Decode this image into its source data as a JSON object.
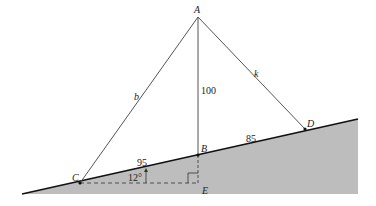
{
  "diagram": {
    "colors": {
      "ground_fill": "#bdbdbd",
      "line": "#555555",
      "slope_line": "#111111"
    },
    "points": {
      "A": {
        "label": "A",
        "x": 198,
        "y": 17
      },
      "B": {
        "label": "B",
        "x": 198,
        "y": 155
      },
      "C": {
        "label": "C",
        "x": 80,
        "y": 183
      },
      "D": {
        "label": "D",
        "x": 305,
        "y": 129
      },
      "E": {
        "label": "E",
        "x": 198,
        "y": 183
      }
    },
    "segment_labels": {
      "AC": "b",
      "AD": "k",
      "AB": "100",
      "CB": "95",
      "BD": "85"
    },
    "angle_label": "12°"
  }
}
